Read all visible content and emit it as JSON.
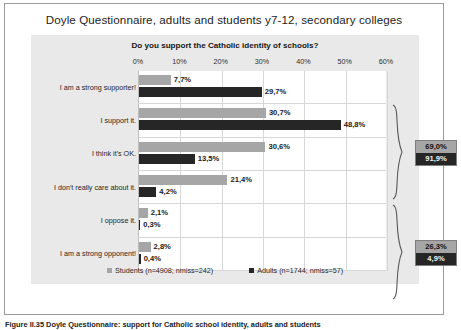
{
  "figure": {
    "title": "Doyle Questionnaire, adults and students y7-12, secondary colleges",
    "caption": "Figure II.35  Doyle Questionnaire: support for Catholic school identity, adults and students"
  },
  "chart_data": {
    "type": "bar",
    "orientation": "horizontal",
    "title": "Do you support the Catholic identity of schools?",
    "xlabel": "",
    "ylabel": "",
    "xlim": [
      0,
      60
    ],
    "xticks": [
      "0%",
      "10%",
      "20%",
      "30%",
      "40%",
      "50%",
      "60%"
    ],
    "xtick_values": [
      0,
      10,
      20,
      30,
      40,
      50,
      60
    ],
    "grid": true,
    "legend_position": "bottom",
    "categories": [
      "I am a strong supporter!",
      "I support it.",
      "I think it's OK.",
      "I don't really care about it.",
      "I oppose it.",
      "I am a strong opponent!"
    ],
    "series": [
      {
        "name": "Students (n=4908; nmiss=242)",
        "short_name": "Students",
        "color": "#a6a6a6",
        "values": [
          7.7,
          30.7,
          30.6,
          21.4,
          2.1,
          2.8
        ],
        "labels": [
          "7,7%",
          "30,7%",
          "30,6%",
          "21,4%",
          "2,1%",
          "2,8%"
        ]
      },
      {
        "name": "Adults (n=1744; nmiss=57)",
        "short_name": "Adults",
        "color": "#262626",
        "values": [
          29.7,
          48.8,
          13.5,
          4.2,
          0.3,
          0.4
        ],
        "labels": [
          "29,7%",
          "48,8%",
          "13,5%",
          "4,2%",
          "0,3%",
          "0,4%"
        ]
      }
    ],
    "annotations": [
      {
        "name": "supportive-total",
        "spans_categories": [
          0,
          1,
          2
        ],
        "students_label": "69,0%",
        "adults_label": "91,9%"
      },
      {
        "name": "nonsupportive-total",
        "spans_categories": [
          3,
          4,
          5
        ],
        "students_label": "26,3%",
        "adults_label": "4,9%"
      }
    ]
  }
}
